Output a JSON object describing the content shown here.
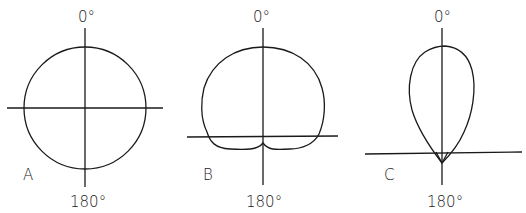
{
  "figure": {
    "panels": [
      {
        "id": "A",
        "label": "A",
        "top_label": "0°",
        "bottom_label": "180°",
        "pattern": "omnidirectional"
      },
      {
        "id": "B",
        "label": "B",
        "top_label": "0°",
        "bottom_label": "180°",
        "pattern": "cardioid"
      },
      {
        "id": "C",
        "label": "C",
        "top_label": "0°",
        "bottom_label": "180°",
        "pattern": "supercardioid-teardrop"
      }
    ],
    "colors": {
      "line": "#1a1a1a",
      "background": "#ffffff"
    }
  }
}
